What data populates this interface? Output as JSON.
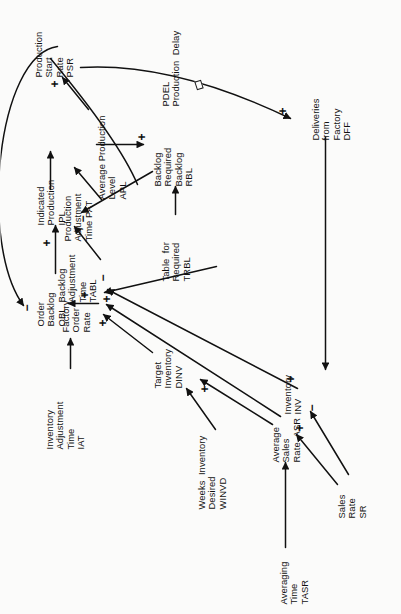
{
  "figure": {
    "orientation": "rotated-90-ccw",
    "type": "causal-loop-diagram",
    "ink_color": "#111111",
    "paper_color": "#fbfbfa"
  },
  "nodes": [
    {
      "id": "iat",
      "lines": "Inventory\nAdjustment\nTime\nIAT"
    },
    {
      "id": "tabl",
      "lines": "Backlog\nAdjustment\nTime\nTABL"
    },
    {
      "id": "pat",
      "lines": "Production\nAdjustment\nTime PAT"
    },
    {
      "id": "obl",
      "lines": "Order\nBacklog\nOBL"
    },
    {
      "id": "ipl",
      "lines": "Indicated\nProduction\nIPL"
    },
    {
      "id": "apl",
      "lines": "Average Production\nLevel\nAPL"
    },
    {
      "id": "psr",
      "lines": "Production\nStart\nRate\nPSR"
    },
    {
      "id": "for",
      "lines": "Factory\nOrder\nRate"
    },
    {
      "id": "trbl",
      "lines": "Table  for\nRequired\nTRBL"
    },
    {
      "id": "rbl",
      "lines": "Backlog\nRequired\nBacklog\nRBL"
    },
    {
      "id": "pdel",
      "lines": "PDEL\nProduction  Delay"
    },
    {
      "id": "winvd",
      "lines": "Weeks  Inventory\nDesired\nWINVD"
    },
    {
      "id": "dinv",
      "lines": "Target\nInventory\nDINV"
    },
    {
      "id": "asr",
      "lines": "Average\nSales\nRate  ASR"
    },
    {
      "id": "inv",
      "lines": "Inventory\nINV"
    },
    {
      "id": "tasr",
      "lines": "Averaging\nTime\nTASR"
    },
    {
      "id": "sr",
      "lines": "Sales\nRate\nSR"
    },
    {
      "id": "dff",
      "lines": "Deliveries\nfrom\nFactory\nDFF"
    }
  ],
  "signs": [
    {
      "id": "s-obl-feedback",
      "symbol": "−"
    },
    {
      "id": "s-for-to-obl",
      "symbol": "+"
    },
    {
      "id": "s-obl-to-ipl",
      "symbol": "+"
    },
    {
      "id": "s-ipl-minus",
      "symbol": "−"
    },
    {
      "id": "s-apl-to-psr",
      "symbol": "+"
    },
    {
      "id": "s-for-plus-left",
      "symbol": "+"
    },
    {
      "id": "s-for-plus-mid",
      "symbol": "+"
    },
    {
      "id": "s-for-minus",
      "symbol": "−"
    },
    {
      "id": "s-dinv",
      "symbol": "+"
    },
    {
      "id": "s-asr-plus",
      "symbol": "+"
    },
    {
      "id": "s-inv-minus",
      "symbol": "−"
    },
    {
      "id": "s-inv-plus",
      "symbol": "+"
    },
    {
      "id": "s-rbl-plus",
      "symbol": "+"
    },
    {
      "id": "s-psr-in-plus",
      "symbol": "+"
    }
  ],
  "delay_markers": [
    {
      "id": "pdel-delay-marker",
      "on_link": "PSR to DFF"
    }
  ]
}
